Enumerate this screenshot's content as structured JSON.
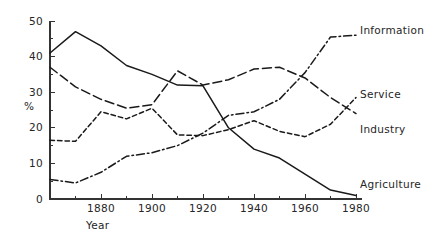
{
  "chart_data": {
    "type": "line",
    "title": "",
    "subtitle": "",
    "xlabel": "Year",
    "ylabel": "%",
    "xlim": [
      1860,
      1980
    ],
    "ylim": [
      0,
      50
    ],
    "grid": false,
    "legend_position": "right-inline-labels",
    "x_ticks": [
      1880,
      1900,
      1920,
      1940,
      1960,
      1980
    ],
    "x_tick_labels": [
      "1880",
      "1900",
      "1920",
      "1940",
      "1960",
      "1980"
    ],
    "x_minor_ticks": [
      1870,
      1890,
      1910,
      1930,
      1950,
      1970
    ],
    "y_ticks": [
      0,
      10,
      20,
      30,
      40,
      50
    ],
    "y_tick_labels": [
      "0",
      "10",
      "20",
      "30",
      "40",
      "50"
    ],
    "y_minor_ticks": [
      5,
      15,
      25,
      35,
      45
    ],
    "x": [
      1860,
      1870,
      1880,
      1890,
      1900,
      1910,
      1920,
      1930,
      1940,
      1950,
      1960,
      1970,
      1980
    ],
    "series": [
      {
        "name": "Agriculture",
        "dash": "solid",
        "label": "Agriculture",
        "label_x": 1983,
        "label_y": 4.2,
        "values": [
          41.0,
          47.0,
          43.0,
          37.5,
          35.0,
          32.0,
          31.8,
          20.0,
          14.0,
          11.5,
          7.0,
          2.5,
          1.0
        ]
      },
      {
        "name": "Service",
        "dash": "long-dash",
        "label": "Service",
        "label_x": 1983,
        "label_y": 29.5,
        "values": [
          37.0,
          31.5,
          28.0,
          25.5,
          26.5,
          36.0,
          32.0,
          33.5,
          36.5,
          37.0,
          34.0,
          28.5,
          24.0
        ]
      },
      {
        "name": "Industry",
        "dash": "short-dash",
        "label": "Industry",
        "label_x": 1983,
        "label_y": 19.5,
        "values": [
          16.5,
          16.2,
          24.5,
          22.5,
          25.5,
          18.0,
          17.8,
          19.5,
          22.0,
          19.0,
          17.5,
          21.0,
          28.5
        ]
      },
      {
        "name": "Information",
        "dash": "dash-dot",
        "label": "Information",
        "label_x": 1983,
        "label_y": 47.5,
        "values": [
          5.5,
          4.5,
          7.5,
          12.0,
          13.0,
          15.0,
          18.5,
          23.5,
          24.5,
          28.0,
          35.5,
          45.5,
          46.0
        ]
      }
    ]
  },
  "axes": {
    "y_axis_label": "%",
    "x_axis_label": "Year"
  }
}
